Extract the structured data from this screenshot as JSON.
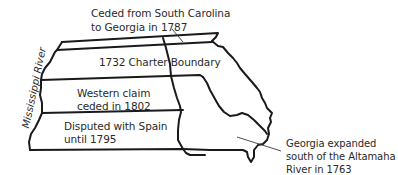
{
  "map": {
    "title": "Georgia colonial boundaries",
    "colors": {
      "line": "#1a1a1a",
      "text": "#2a2a2a",
      "background": "#ffffff"
    },
    "labels": {
      "ceded_sc_line1": "Ceded from South Carolina",
      "ceded_sc_line2": "to Georgia in 1787",
      "charter": "1732 Charter Boundary",
      "western_line1": "Western claim",
      "western_line2": "ceded in 1802",
      "spain_line1": "Disputed with Spain",
      "spain_line2": "until 1795",
      "expanded_line1": "Georgia expanded",
      "expanded_line2": "south of the Altamaha",
      "expanded_line3": "River in 1763",
      "river": "Mississippi River"
    }
  }
}
